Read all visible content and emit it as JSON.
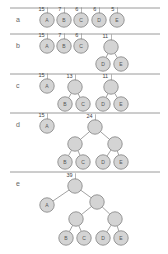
{
  "rows": [
    {
      "label": "a",
      "line_y": 8,
      "label_y": 20,
      "nodes": [
        {
          "id": "A",
          "text": "A",
          "x": 47,
          "y": 20,
          "weight": "15"
        },
        {
          "id": "B",
          "text": "B",
          "x": 64,
          "y": 20,
          "weight": "7"
        },
        {
          "id": "C",
          "text": "C",
          "x": 81,
          "y": 20,
          "weight": "6"
        },
        {
          "id": "D",
          "text": "D",
          "x": 99,
          "y": 20,
          "weight": "6"
        },
        {
          "id": "E",
          "text": "E",
          "x": 117,
          "y": 20,
          "weight": "5"
        }
      ],
      "edges": []
    },
    {
      "label": "b",
      "line_y": 34,
      "label_y": 46,
      "nodes": [
        {
          "id": "A",
          "text": "A",
          "x": 47,
          "y": 46,
          "weight": "15"
        },
        {
          "id": "B",
          "text": "B",
          "x": 64,
          "y": 46,
          "weight": "7"
        },
        {
          "id": "C",
          "text": "C",
          "x": 81,
          "y": 46,
          "weight": "6"
        },
        {
          "id": "DE",
          "text": "",
          "x": 111,
          "y": 47,
          "weight": "11"
        },
        {
          "id": "D",
          "text": "D",
          "x": 103,
          "y": 64,
          "weight": ""
        },
        {
          "id": "E",
          "text": "E",
          "x": 121,
          "y": 64,
          "weight": ""
        }
      ],
      "edges": [
        [
          "DE",
          "D"
        ],
        [
          "DE",
          "E"
        ]
      ]
    },
    {
      "label": "c",
      "line_y": 74,
      "label_y": 86,
      "nodes": [
        {
          "id": "A",
          "text": "A",
          "x": 47,
          "y": 86,
          "weight": "15"
        },
        {
          "id": "BC",
          "text": "",
          "x": 75,
          "y": 87,
          "weight": "13"
        },
        {
          "id": "DE",
          "text": "",
          "x": 111,
          "y": 87,
          "weight": "11"
        },
        {
          "id": "B",
          "text": "B",
          "x": 65,
          "y": 104,
          "weight": ""
        },
        {
          "id": "C",
          "text": "C",
          "x": 83,
          "y": 104,
          "weight": ""
        },
        {
          "id": "D",
          "text": "D",
          "x": 103,
          "y": 104,
          "weight": ""
        },
        {
          "id": "E",
          "text": "E",
          "x": 121,
          "y": 104,
          "weight": ""
        }
      ],
      "edges": [
        [
          "BC",
          "B"
        ],
        [
          "BC",
          "C"
        ],
        [
          "DE",
          "D"
        ],
        [
          "DE",
          "E"
        ]
      ]
    },
    {
      "label": "d",
      "line_y": 113,
      "label_y": 125,
      "nodes": [
        {
          "id": "A",
          "text": "A",
          "x": 47,
          "y": 126,
          "weight": "15"
        },
        {
          "id": "BCDE",
          "text": "",
          "x": 95,
          "y": 127,
          "weight": "24"
        },
        {
          "id": "BC",
          "text": "",
          "x": 75,
          "y": 144,
          "weight": ""
        },
        {
          "id": "DE",
          "text": "",
          "x": 115,
          "y": 144,
          "weight": ""
        },
        {
          "id": "B",
          "text": "B",
          "x": 65,
          "y": 162,
          "weight": ""
        },
        {
          "id": "C",
          "text": "C",
          "x": 83,
          "y": 162,
          "weight": ""
        },
        {
          "id": "D",
          "text": "D",
          "x": 103,
          "y": 162,
          "weight": ""
        },
        {
          "id": "E",
          "text": "E",
          "x": 121,
          "y": 162,
          "weight": ""
        }
      ],
      "edges": [
        [
          "BCDE",
          "BC"
        ],
        [
          "BCDE",
          "DE"
        ],
        [
          "BC",
          "B"
        ],
        [
          "BC",
          "C"
        ],
        [
          "DE",
          "D"
        ],
        [
          "DE",
          "E"
        ]
      ]
    },
    {
      "label": "e",
      "line_y": 172,
      "label_y": 184,
      "nodes": [
        {
          "id": "ROOT",
          "text": "",
          "x": 75,
          "y": 186,
          "weight": "39"
        },
        {
          "id": "A",
          "text": "A",
          "x": 47,
          "y": 205,
          "weight": ""
        },
        {
          "id": "BCDE",
          "text": "",
          "x": 97,
          "y": 202,
          "weight": ""
        },
        {
          "id": "BC",
          "text": "",
          "x": 76,
          "y": 219,
          "weight": ""
        },
        {
          "id": "DE",
          "text": "",
          "x": 115,
          "y": 219,
          "weight": ""
        },
        {
          "id": "B",
          "text": "B",
          "x": 66,
          "y": 238,
          "weight": ""
        },
        {
          "id": "C",
          "text": "C",
          "x": 84,
          "y": 238,
          "weight": ""
        },
        {
          "id": "D",
          "text": "D",
          "x": 103,
          "y": 238,
          "weight": ""
        },
        {
          "id": "E",
          "text": "E",
          "x": 121,
          "y": 238,
          "weight": ""
        }
      ],
      "edges": [
        [
          "ROOT",
          "A"
        ],
        [
          "ROOT",
          "BCDE"
        ],
        [
          "BCDE",
          "BC"
        ],
        [
          "BCDE",
          "DE"
        ],
        [
          "BC",
          "B"
        ],
        [
          "BC",
          "C"
        ],
        [
          "DE",
          "D"
        ],
        [
          "DE",
          "E"
        ]
      ]
    }
  ],
  "style": {
    "node_fill": "#d4d4d4",
    "node_stroke": "#8c8c8c",
    "line_color": "#9a9a9a"
  }
}
